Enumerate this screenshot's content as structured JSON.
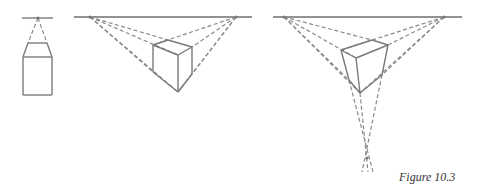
{
  "figure": {
    "caption": "Figure 10.3",
    "panels": [
      {
        "name": "one-point-perspective",
        "horizon": [
          [
            22,
            18
          ],
          [
            53,
            18
          ]
        ],
        "vanishing_points": [
          [
            38,
            18
          ]
        ],
        "box_edges": [
          [
            [
              28,
              43
            ],
            [
              47,
              43
            ]
          ],
          [
            [
              23,
              57
            ],
            [
              52,
              57
            ]
          ],
          [
            [
              23,
              57
            ],
            [
              23,
              95
            ]
          ],
          [
            [
              52,
              57
            ],
            [
              52,
              95
            ]
          ],
          [
            [
              23,
              95
            ],
            [
              52,
              95
            ]
          ],
          [
            [
              28,
              43
            ],
            [
              23,
              57
            ]
          ],
          [
            [
              47,
              43
            ],
            [
              52,
              57
            ]
          ]
        ],
        "construction_lines": [
          [
            [
              38,
              18
            ],
            [
              28,
              43
            ]
          ],
          [
            [
              38,
              18
            ],
            [
              47,
              43
            ]
          ]
        ]
      },
      {
        "name": "two-point-perspective",
        "horizon": [
          [
            74,
            17
          ],
          [
            252,
            17
          ]
        ],
        "vanishing_points": [
          [
            90,
            17
          ],
          [
            236,
            17
          ]
        ],
        "box_edges": [
          [
            [
              153,
              45
            ],
            [
              168,
              40
            ]
          ],
          [
            [
              168,
              40
            ],
            [
              192,
              47
            ]
          ],
          [
            [
              192,
              47
            ],
            [
              178,
              55
            ]
          ],
          [
            [
              178,
              55
            ],
            [
              153,
              45
            ]
          ],
          [
            [
              153,
              45
            ],
            [
              153,
              72
            ]
          ],
          [
            [
              178,
              55
            ],
            [
              178,
              92
            ]
          ],
          [
            [
              192,
              47
            ],
            [
              192,
              74
            ]
          ],
          [
            [
              153,
              72
            ],
            [
              178,
              92
            ]
          ],
          [
            [
              178,
              92
            ],
            [
              192,
              74
            ]
          ]
        ],
        "construction_lines": [
          [
            [
              90,
              17
            ],
            [
              168,
              40
            ]
          ],
          [
            [
              90,
              17
            ],
            [
              178,
              55
            ]
          ],
          [
            [
              90,
              17
            ],
            [
              153,
              72
            ]
          ],
          [
            [
              90,
              17
            ],
            [
              178,
              92
            ]
          ],
          [
            [
              236,
              17
            ],
            [
              153,
              45
            ]
          ],
          [
            [
              236,
              17
            ],
            [
              192,
              47
            ]
          ],
          [
            [
              236,
              17
            ],
            [
              192,
              74
            ]
          ],
          [
            [
              236,
              17
            ],
            [
              178,
              92
            ]
          ]
        ]
      },
      {
        "name": "three-point-perspective",
        "horizon": [
          [
            273,
            17
          ],
          [
            462,
            17
          ]
        ],
        "vanishing_points": [
          [
            284,
            17
          ],
          [
            444,
            17
          ],
          [
            367,
            158
          ]
        ],
        "box_edges": [
          [
            [
              341,
              50
            ],
            [
              372,
              40
            ]
          ],
          [
            [
              372,
              40
            ],
            [
              388,
              45
            ]
          ],
          [
            [
              388,
              45
            ],
            [
              356,
              58
            ]
          ],
          [
            [
              356,
              58
            ],
            [
              341,
              50
            ]
          ],
          [
            [
              341,
              50
            ],
            [
              349,
              80
            ]
          ],
          [
            [
              356,
              58
            ],
            [
              360,
              93
            ]
          ],
          [
            [
              388,
              45
            ],
            [
              382,
              75
            ]
          ],
          [
            [
              349,
              80
            ],
            [
              360,
              93
            ]
          ],
          [
            [
              360,
              93
            ],
            [
              382,
              75
            ]
          ]
        ],
        "construction_lines": [
          [
            [
              284,
              17
            ],
            [
              372,
              40
            ]
          ],
          [
            [
              284,
              17
            ],
            [
              356,
              58
            ]
          ],
          [
            [
              284,
              17
            ],
            [
              349,
              80
            ]
          ],
          [
            [
              284,
              17
            ],
            [
              360,
              93
            ]
          ],
          [
            [
              444,
              17
            ],
            [
              341,
              50
            ]
          ],
          [
            [
              444,
              17
            ],
            [
              388,
              45
            ]
          ],
          [
            [
              444,
              17
            ],
            [
              382,
              75
            ]
          ],
          [
            [
              444,
              17
            ],
            [
              360,
              93
            ]
          ],
          [
            [
              349,
              80
            ],
            [
              373,
              172
            ]
          ],
          [
            [
              382,
              75
            ],
            [
              362,
              172
            ]
          ],
          [
            [
              360,
              93
            ],
            [
              368,
              172
            ]
          ]
        ]
      }
    ]
  }
}
